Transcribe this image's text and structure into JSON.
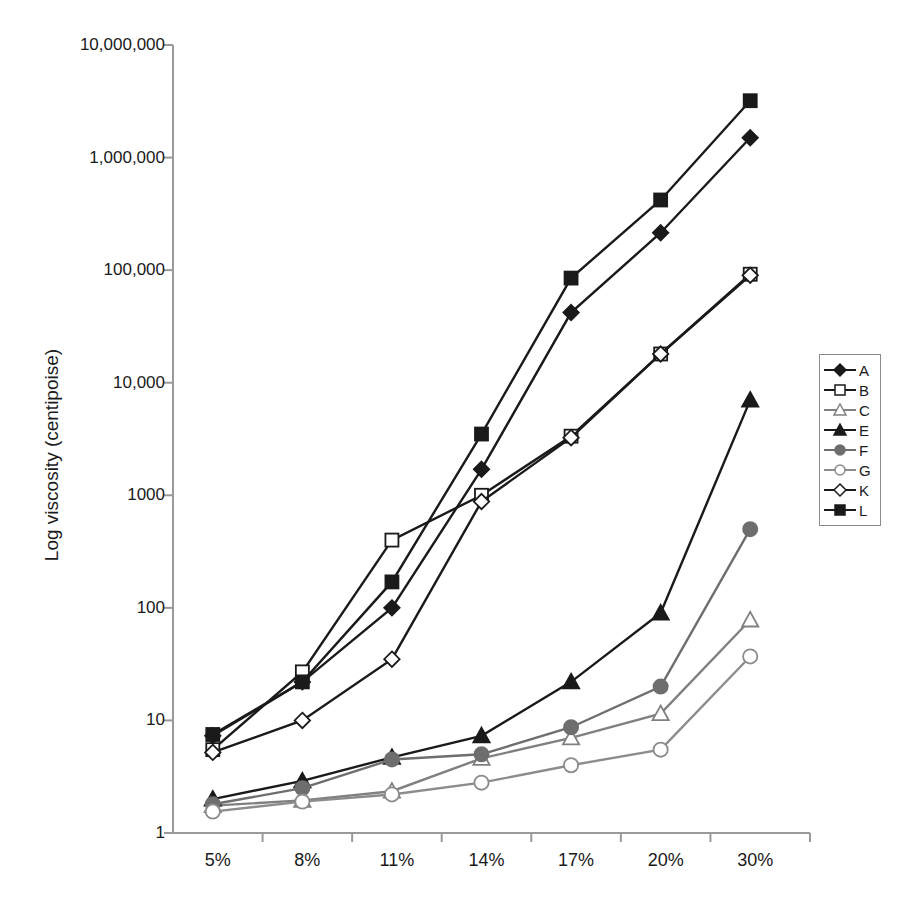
{
  "chart_data": {
    "type": "line",
    "title": "",
    "xlabel": "",
    "ylabel": "Log viscosity (centipoise)",
    "categories": [
      "5%",
      "8%",
      "11%",
      "14%",
      "17%",
      "20%",
      "30%"
    ],
    "yscale": "log",
    "ylim": [
      1,
      10000000
    ],
    "ytick_labels": [
      "10,000,000",
      "1,000,000",
      "100,000",
      "10,000",
      "1000",
      "100",
      "10",
      "1"
    ],
    "ytick_values": [
      10000000,
      1000000,
      100000,
      10000,
      1000,
      100,
      10,
      1
    ],
    "grid": false,
    "legend_position": "right",
    "series": [
      {
        "name": "A",
        "marker": "filled-diamond",
        "color": "#1a1a1a",
        "values": [
          7.3,
          22,
          100,
          1700,
          42000,
          215000,
          1500000
        ]
      },
      {
        "name": "B",
        "marker": "open-square",
        "color": "#1a1a1a",
        "values": [
          5.5,
          27,
          400,
          1000,
          3350,
          18000,
          92000
        ]
      },
      {
        "name": "C",
        "marker": "open-triangle",
        "color": "#808080",
        "values": [
          1.75,
          1.95,
          2.35,
          4.6,
          7.0,
          11.5,
          78
        ]
      },
      {
        "name": "E",
        "marker": "filled-triangle",
        "color": "#1a1a1a",
        "values": [
          2.0,
          2.9,
          4.7,
          7.3,
          22,
          90,
          7000
        ]
      },
      {
        "name": "F",
        "marker": "filled-circle",
        "color": "#6e6e6e",
        "values": [
          1.8,
          2.5,
          4.5,
          5.0,
          8.7,
          20,
          500
        ]
      },
      {
        "name": "G",
        "marker": "open-circle",
        "color": "#8c8c8c",
        "values": [
          1.55,
          1.9,
          2.2,
          2.8,
          4.0,
          5.5,
          37
        ]
      },
      {
        "name": "K",
        "marker": "open-diamond",
        "color": "#1a1a1a",
        "values": [
          5.2,
          10,
          35,
          880,
          3250,
          18000,
          90000
        ]
      },
      {
        "name": "L",
        "marker": "filled-square",
        "color": "#1a1a1a",
        "values": [
          7.5,
          22,
          170,
          3500,
          85000,
          420000,
          3200000
        ]
      }
    ]
  },
  "axis": {
    "y_label": "Log viscosity (centipoise)"
  },
  "legend": {
    "entries": [
      {
        "label": "A",
        "marker": "filled-diamond"
      },
      {
        "label": "B",
        "marker": "open-square"
      },
      {
        "label": "C",
        "marker": "open-triangle"
      },
      {
        "label": "E",
        "marker": "filled-triangle"
      },
      {
        "label": "F",
        "marker": "filled-circle"
      },
      {
        "label": "G",
        "marker": "open-circle"
      },
      {
        "label": "K",
        "marker": "open-diamond"
      },
      {
        "label": "L",
        "marker": "filled-square"
      }
    ]
  }
}
